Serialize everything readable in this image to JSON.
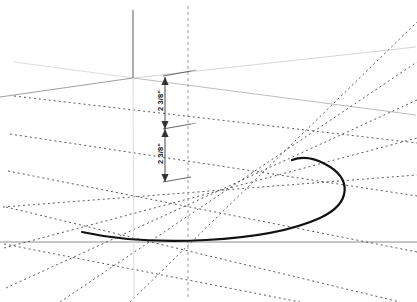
{
  "viewport": {
    "name": "3d-model-viewport",
    "width": 417,
    "height": 302,
    "background_color": "#ffffff"
  },
  "dimensions": [
    {
      "id": "upper",
      "label": "2 3/8\"",
      "value": "2 3/8",
      "unit": "inch",
      "orientation": "vertical",
      "text_rotation_deg": -90,
      "color": "#1b1b1b",
      "line_x": 165,
      "y_start": 77,
      "y_end": 129,
      "witness_x_end": 191
    },
    {
      "id": "lower",
      "label": "2 3/8\"",
      "value": "2 3/8",
      "unit": "inch",
      "orientation": "vertical",
      "text_rotation_deg": -90,
      "color": "#1b1b1b",
      "line_x": 165,
      "y_start": 129,
      "y_end": 182,
      "witness_x_end": 191
    }
  ],
  "axes": {
    "origin": {
      "x": 133,
      "y": 78
    },
    "vertical_axis": {
      "name": "z-axis",
      "color_above": "#6a6a6a",
      "color_below": "#e2e2e2",
      "top_y": 10,
      "bottom_y": 298
    },
    "left_axis": {
      "name": "x-axis",
      "color": "#7a7a7a",
      "end": {
        "x": 14,
        "y": 98
      }
    },
    "right_axis": {
      "name": "y-axis",
      "color": "#d2d2d2",
      "end": {
        "x": 416,
        "y": 47
      }
    },
    "vertical_dashed_axis": {
      "name": "construction-axis",
      "color": "#9a9a9a",
      "x": 188,
      "top_y": 6,
      "bottom_y": 300
    }
  },
  "grid": {
    "name": "perspective-grid",
    "dash_color": "#4a4a4a",
    "dash_pattern": "2 3",
    "slope_down_right_lines": 5,
    "slope_up_right_lines": 5,
    "solid_guide_color": "#b9b9b9"
  },
  "geometry": {
    "arc": {
      "name": "ellipse-arc-profile",
      "color": "#111111",
      "stroke_width": 2.2,
      "start": {
        "x": 82,
        "y": 232
      },
      "end": {
        "x": 292,
        "y": 160
      },
      "rightmost": {
        "x": 345,
        "y": 196
      }
    }
  },
  "toolbar": {
    "visible": false
  }
}
